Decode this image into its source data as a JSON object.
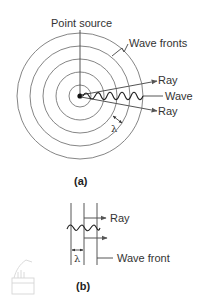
{
  "figure_a": {
    "caption": "(a)",
    "labels": {
      "point_source": "Point source",
      "wave_fronts": "Wave fronts",
      "ray_upper": "Ray",
      "wave": "Wave",
      "ray_lower": "Ray",
      "wavelength": "λ"
    },
    "center": [
      80,
      96
    ],
    "circle_radii": [
      11,
      24,
      37,
      50,
      63
    ]
  },
  "figure_b": {
    "caption": "(b)",
    "labels": {
      "ray": "Ray",
      "wave_front": "Wave front",
      "wavelength": "λ"
    }
  },
  "colors": {
    "line": "#444444",
    "circle": "#777777",
    "text": "#333333"
  }
}
